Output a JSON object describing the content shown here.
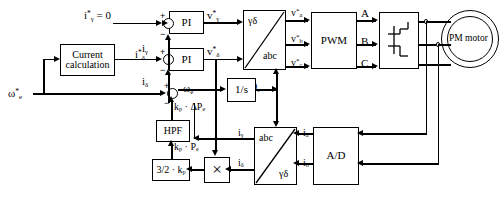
{
  "diagram": {
    "blocks": {
      "current_calc": "Current\ncalculation",
      "pi_gamma": "PI",
      "pi_delta": "PI",
      "integrator": "1/s",
      "hpf": "HPF",
      "gain_32kp": "3/2 · k",
      "gain_32kp_sub": "p",
      "pwm": "PWM",
      "inverter": "",
      "ad": "A/D",
      "motor": "PM motor",
      "transform_fwd_in": "γδ",
      "transform_fwd_out": "abc",
      "transform_rev_in": "abc",
      "transform_rev_out": "γδ",
      "multiplier": "×"
    },
    "signals": {
      "i_gamma_ref": "i*γ = 0",
      "i_delta_ref": "i*δ",
      "i_gamma_fb": "iγ",
      "i_delta_fb": "iδ",
      "v_gamma_ref": "v*γ",
      "v_delta_ref": "v*δ",
      "v_a_ref": "v*a",
      "v_b_ref": "v*b",
      "v_c_ref": "v*c",
      "phase_a": "A",
      "phase_b": "B",
      "phase_c": "C",
      "omega_e_ref": "ω*e",
      "omega_e": "ωe",
      "theta_e": "θe",
      "kp_delta_pe": "kp · ΔPe",
      "kp_pe": "kp · Pe",
      "i_a": "ia",
      "i_b": "ib",
      "plus": "+",
      "minus": "−"
    }
  }
}
